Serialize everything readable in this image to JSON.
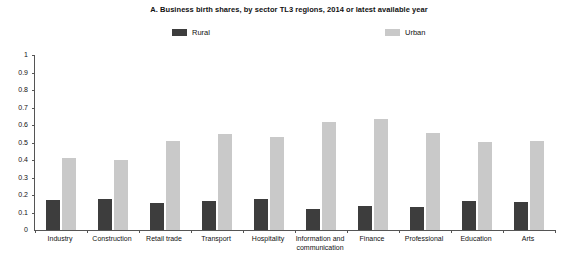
{
  "chart_data": {
    "type": "bar",
    "title": "A. Business birth shares, by sector TL3 regions, 2014 or latest available year",
    "xlabel": "",
    "ylabel": "",
    "ylim": [
      0,
      1
    ],
    "y_ticks": [
      "0",
      "0.1",
      "0.2",
      "0.3",
      "0.4",
      "0.5",
      "0.6",
      "0.7",
      "0.8",
      "0.9",
      "1"
    ],
    "grid": false,
    "legend_position": "top-center",
    "categories": [
      "Industry",
      "Construction",
      "Retail trade",
      "Transport",
      "Hospitality",
      "Information and communication",
      "Finance",
      "Professional",
      "Education",
      "Arts"
    ],
    "series": [
      {
        "name": "Rural",
        "color": "#3d3d3d",
        "values": [
          0.17,
          0.18,
          0.155,
          0.165,
          0.175,
          0.12,
          0.14,
          0.13,
          0.165,
          0.16
        ]
      },
      {
        "name": "Urban",
        "color": "#c9c9c9",
        "values": [
          0.41,
          0.4,
          0.51,
          0.55,
          0.53,
          0.615,
          0.635,
          0.555,
          0.505,
          0.51
        ]
      }
    ]
  },
  "axis": {
    "line_color": "#555555"
  }
}
